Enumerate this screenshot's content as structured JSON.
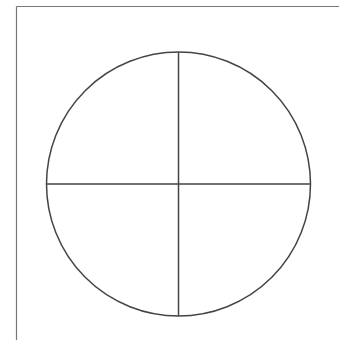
{
  "diagram": {
    "type": "circle-quadrants",
    "frame": {
      "left": 16.5,
      "top": 6.5,
      "right": 339,
      "bottom": 340,
      "color": "#777777"
    },
    "circle": {
      "cx": 178.5,
      "cy": 184,
      "r": 132,
      "stroke": "#444444",
      "stroke_width": 1.5
    },
    "lines": [
      {
        "name": "vertical-divider",
        "x1": 178.5,
        "y1": 52,
        "x2": 178.5,
        "y2": 316
      },
      {
        "name": "horizontal-divider",
        "x1": 46.5,
        "y1": 184,
        "x2": 310.5,
        "y2": 184
      }
    ],
    "quadrant_count": 4
  }
}
